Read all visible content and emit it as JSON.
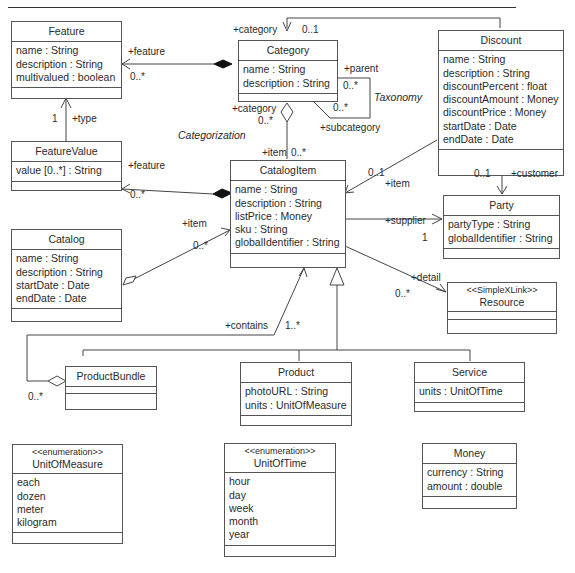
{
  "diagram": {
    "type": "UML class diagram",
    "classes": {
      "feature": {
        "name": "Feature",
        "attributes": [
          "name : String",
          "description : String",
          "multivalued : boolean"
        ]
      },
      "category": {
        "name": "Category",
        "attributes": [
          "name : String",
          "description : String"
        ]
      },
      "discount": {
        "name": "Discount",
        "attributes": [
          "name : String",
          "description : String",
          "discountPercent : float",
          "discountAmount : Money",
          "discountPrice : Money",
          "startDate : Date",
          "endDate : Date"
        ]
      },
      "feature_value": {
        "name": "FeatureValue",
        "attributes": [
          "value [0..*] : String"
        ]
      },
      "catalog_item": {
        "name": "CatalogItem",
        "attributes": [
          "name : String",
          "description : String",
          "listPrice : Money",
          "sku : String",
          "globalIdentifier : String"
        ]
      },
      "party": {
        "name": "Party",
        "attributes": [
          "partyType : String",
          "globalIdentifier : String"
        ]
      },
      "catalog": {
        "name": "Catalog",
        "attributes": [
          "name : String",
          "description : String",
          "startDate : Date",
          "endDate : Date"
        ]
      },
      "resource": {
        "stereotype": "<<SimpleXLink>>",
        "name": "Resource",
        "attributes": []
      },
      "product_bundle": {
        "name": "ProductBundle",
        "attributes": []
      },
      "product": {
        "name": "Product",
        "attributes": [
          "photoURL : String",
          "units : UnitOfMeasure"
        ]
      },
      "service": {
        "name": "Service",
        "attributes": [
          "units : UnitOfTime"
        ]
      },
      "unit_of_measure": {
        "stereotype": "<<enumeration>>",
        "name": "UnitOfMeasure",
        "attributes": [
          "each",
          "dozen",
          "meter",
          "kilogram"
        ]
      },
      "unit_of_time": {
        "stereotype": "<<enumeration>>",
        "name": "UnitOfTime",
        "attributes": [
          "hour",
          "day",
          "week",
          "month",
          "year"
        ]
      },
      "money": {
        "name": "Money",
        "attributes": [
          "currency : String",
          "amount : double"
        ]
      }
    },
    "labels": {
      "category_feature_role": "+feature",
      "category_feature_mult": "0..*",
      "feature_type_mult": "1",
      "feature_type_role": "+type",
      "discount_category_role": "+category",
      "discount_category_mult": "0..1",
      "taxonomy_parent_role": "+parent",
      "taxonomy_parent_mult": "0..*",
      "taxonomy_sub_mult": "0..*",
      "taxonomy_sub_role": "+subcategory",
      "taxonomy_name": "Taxonomy",
      "categorization_cat_role": "+category",
      "categorization_cat_mult": "0..*",
      "categorization_name": "Categorization",
      "categorization_item_role": "+item",
      "categorization_item_mult": "0..*",
      "item_featurevalue_role": "+feature",
      "item_featurevalue_mult": "0..*",
      "discount_item_mult": "0..1",
      "discount_item_role": "+item",
      "discount_customer_mult": "0..1",
      "discount_customer_role": "+customer",
      "catalog_item_role": "+item",
      "catalog_item_mult": "0..*",
      "supplier_role": "+supplier",
      "supplier_mult": "1",
      "detail_role": "+detail",
      "detail_mult": "0..*",
      "contains_role": "+contains",
      "contains_mult": "1..*",
      "bundle_mult": "0..*"
    }
  }
}
